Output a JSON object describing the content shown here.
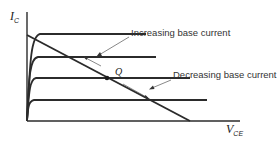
{
  "diagram": {
    "type": "transistor-characteristic-curves-with-load-line",
    "y_axis": {
      "label": "I",
      "subscript": "C"
    },
    "x_axis": {
      "label": "V",
      "subscript": "CE"
    },
    "q_point": {
      "label": "Q"
    },
    "annotations": {
      "increasing": "Increasing base current",
      "decreasing": "Decreasing base current"
    },
    "colors": {
      "line": "#2b2b2b",
      "text": "#333333",
      "background": "#ffffff"
    }
  }
}
